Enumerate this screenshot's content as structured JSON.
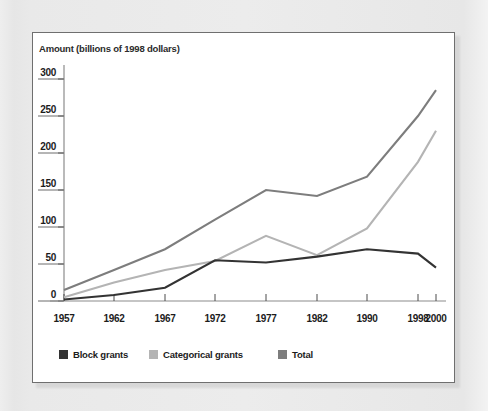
{
  "panel": {
    "background_color": "#ffffff",
    "border_color": "#6f6f6f",
    "page_background_color": "#e9e9e9"
  },
  "chart_data": {
    "type": "line",
    "title": "",
    "ylabel": "Amount (billions of 1998 dollars)",
    "xlabel": "",
    "categories": [
      "1957",
      "1962",
      "1967",
      "1972",
      "1977",
      "1982",
      "1990",
      "1998",
      "2000"
    ],
    "ylim": [
      0,
      300
    ],
    "yticks": [
      0,
      50,
      100,
      150,
      200,
      250,
      300
    ],
    "ytick_labels": [
      "0",
      "50",
      "100",
      "150",
      "200",
      "250",
      "300"
    ],
    "grid": false,
    "legend_position": "below-plot",
    "series": [
      {
        "name": "Block grants",
        "color": "#333333",
        "values": [
          2,
          8,
          18,
          55,
          52,
          60,
          70,
          64,
          45
        ]
      },
      {
        "name": "Categorical grants",
        "color": "#b4b4b4",
        "values": [
          5,
          25,
          42,
          54,
          88,
          62,
          98,
          188,
          230
        ]
      },
      {
        "name": "Total",
        "color": "#7d7d7d",
        "values": [
          15,
          42,
          70,
          110,
          150,
          142,
          168,
          250,
          285
        ]
      }
    ]
  },
  "legend": {
    "items": [
      {
        "label": "Block grants",
        "color": "#333333"
      },
      {
        "label": "Categorical grants",
        "color": "#b4b4b4"
      },
      {
        "label": "Total",
        "color": "#7d7d7d"
      }
    ]
  }
}
